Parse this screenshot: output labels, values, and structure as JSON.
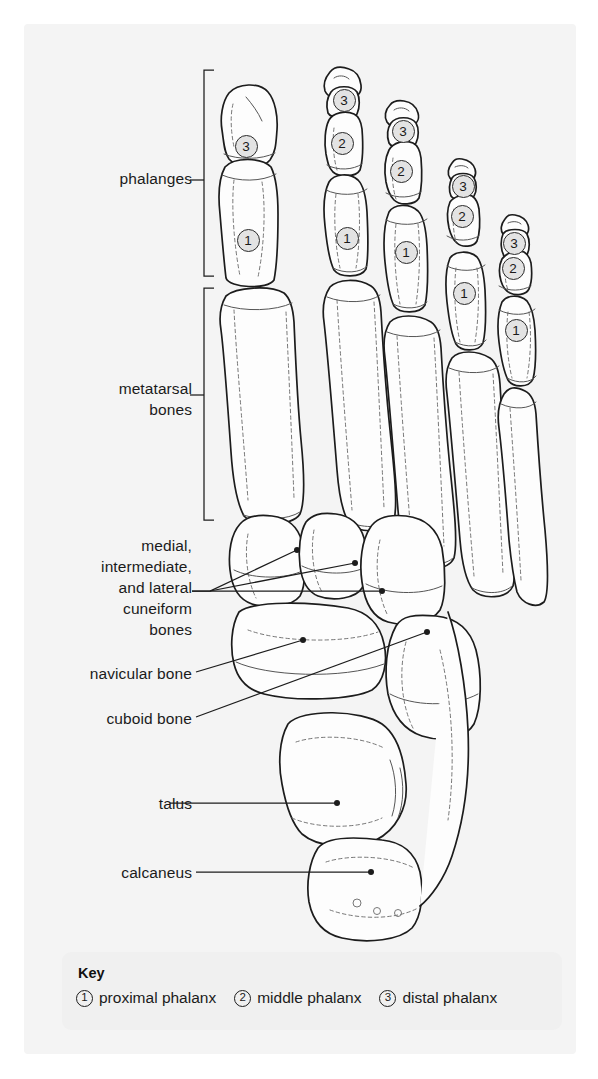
{
  "figure": {
    "background_color": "#f4f4f4",
    "line_color": "#1c1c1c"
  },
  "labels": [
    {
      "id": "phalanges",
      "text": "phalanges",
      "x": 92,
      "y": 168,
      "width": 100,
      "bracket": true
    },
    {
      "id": "metatarsal",
      "text": "metatarsal\nbones",
      "x": 72,
      "y": 378,
      "width": 120,
      "bracket": true
    },
    {
      "id": "cuneiform",
      "text": "medial,\nintermediate,\nand lateral\ncuneiform\nbones",
      "x": 46,
      "y": 535,
      "width": 146,
      "bracket": false
    },
    {
      "id": "navicular",
      "text": "navicular bone",
      "x": 32,
      "y": 665,
      "width": 160,
      "bracket": false
    },
    {
      "id": "cuboid",
      "text": "cuboid bone",
      "x": 52,
      "y": 710,
      "width": 140,
      "bracket": false
    },
    {
      "id": "talus",
      "text": "talus",
      "x": 102,
      "y": 793,
      "width": 90,
      "bracket": false
    },
    {
      "id": "calcaneus",
      "text": "calcaneus",
      "x": 72,
      "y": 862,
      "width": 120,
      "bracket": false
    }
  ],
  "brackets": [
    {
      "id": "phalanges-bracket",
      "x": 204,
      "y_top": 70,
      "y_bottom": 276,
      "tick_y": 180
    },
    {
      "id": "metatarsal-bracket",
      "x": 204,
      "y_top": 288,
      "y_bottom": 520,
      "tick_y": 395
    }
  ],
  "leaders": [
    {
      "id": "cuneiform-medial-leader",
      "points": "192,590 210,590 297,550",
      "dot": "297,550"
    },
    {
      "id": "cuneiform-intermediate-leader",
      "points": "192,590 210,590 355,563",
      "dot": "355,563"
    },
    {
      "id": "cuneiform-lateral-leader",
      "points": "210,590 382,591",
      "dot": "382,591"
    },
    {
      "id": "navicular-leader",
      "points": "196,672 303,640",
      "dot": "303,640"
    },
    {
      "id": "cuboid-leader",
      "points": "196,717 427,632",
      "dot": "427,632"
    },
    {
      "id": "talus-leader",
      "points": "170,803 337,803",
      "dot": "337,803"
    },
    {
      "id": "calcaneus-leader",
      "points": "196,872 371,872",
      "dot": "371,872"
    }
  ],
  "bone_markers": [
    {
      "id": "toe1-distal",
      "toe": 1,
      "num": "3",
      "x": 246,
      "y": 146
    },
    {
      "id": "toe1-proximal",
      "toe": 1,
      "num": "1",
      "x": 248,
      "y": 240
    },
    {
      "id": "toe2-distal",
      "toe": 2,
      "num": "3",
      "x": 344,
      "y": 100
    },
    {
      "id": "toe2-middle",
      "toe": 2,
      "num": "2",
      "x": 342,
      "y": 143
    },
    {
      "id": "toe2-proximal",
      "toe": 2,
      "num": "1",
      "x": 347,
      "y": 238
    },
    {
      "id": "toe3-distal",
      "toe": 3,
      "num": "3",
      "x": 403,
      "y": 131
    },
    {
      "id": "toe3-middle",
      "toe": 3,
      "num": "2",
      "x": 401,
      "y": 171
    },
    {
      "id": "toe3-proximal",
      "toe": 3,
      "num": "1",
      "x": 406,
      "y": 252
    },
    {
      "id": "toe4-distal",
      "toe": 4,
      "num": "3",
      "x": 463,
      "y": 186
    },
    {
      "id": "toe4-middle",
      "toe": 4,
      "num": "2",
      "x": 462,
      "y": 216
    },
    {
      "id": "toe4-proximal",
      "toe": 4,
      "num": "1",
      "x": 464,
      "y": 293
    },
    {
      "id": "toe5-distal",
      "toe": 5,
      "num": "3",
      "x": 514,
      "y": 243
    },
    {
      "id": "toe5-middle",
      "toe": 5,
      "num": "2",
      "x": 513,
      "y": 268
    },
    {
      "id": "toe5-proximal",
      "toe": 5,
      "num": "1",
      "x": 516,
      "y": 330
    }
  ],
  "key": {
    "title": "Key",
    "items": [
      {
        "num": "1",
        "label": "proximal phalanx"
      },
      {
        "num": "2",
        "label": "middle phalanx"
      },
      {
        "num": "3",
        "label": "distal phalanx"
      }
    ]
  }
}
